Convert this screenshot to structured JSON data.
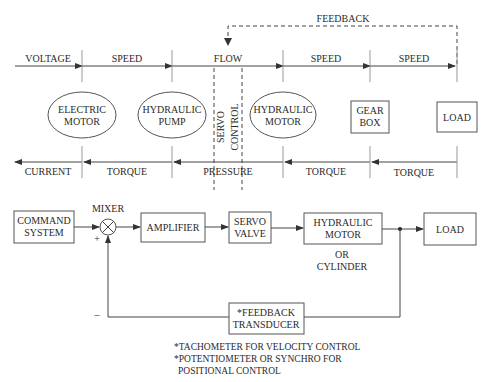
{
  "top_diagram": {
    "feedback_label": "FEEDBACK",
    "forward_labels": [
      "VOLTAGE",
      "SPEED",
      "FLOW",
      "SPEED",
      "SPEED"
    ],
    "return_labels": [
      "CURRENT",
      "TORQUE",
      "PRESSURE",
      "TORQUE",
      "TORQUE"
    ],
    "components": {
      "electric_motor": [
        "ELECTRIC",
        "MOTOR"
      ],
      "hydraulic_pump": [
        "HYDRAULIC",
        "PUMP"
      ],
      "servo_control": [
        "SERVO",
        "CONTROL"
      ],
      "hydraulic_motor": [
        "HYDRAULIC",
        "MOTOR"
      ],
      "gear_box": [
        "GEAR",
        "BOX"
      ],
      "load": "LOAD"
    }
  },
  "bottom_diagram": {
    "command_system": [
      "COMMAND",
      "SYSTEM"
    ],
    "mixer_label": "MIXER",
    "plus_sign": "+",
    "minus_sign": "–",
    "amplifier": "AMPLIFIER",
    "servo_valve": [
      "SERVO",
      "VALVE"
    ],
    "hydraulic_motor": [
      "HYDRAULIC",
      "MOTOR"
    ],
    "or_cylinder": [
      "OR",
      "CYLINDER"
    ],
    "load": "LOAD",
    "feedback_transducer": [
      "*FEEDBACK",
      "TRANSDUCER"
    ]
  },
  "footnotes": [
    "*TACHOMETER FOR VELOCITY CONTROL",
    "*POTENTIOMETER OR SYNCHRO FOR",
    "POSITIONAL CONTROL"
  ]
}
